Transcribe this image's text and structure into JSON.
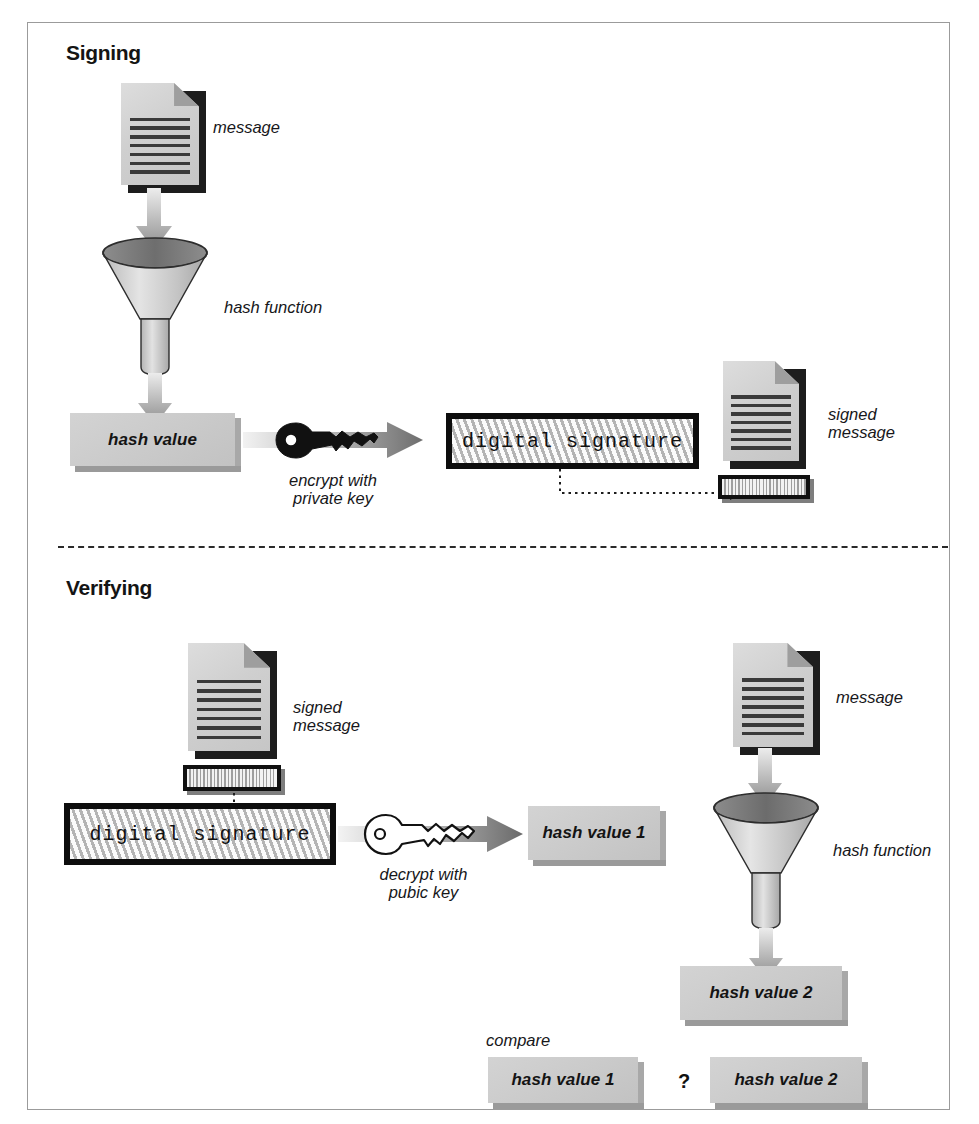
{
  "figure": {
    "sections": [
      {
        "id": "signing",
        "label": "Signing"
      },
      {
        "id": "verifying",
        "label": "Verifying"
      }
    ]
  },
  "signing": {
    "heading": "Signing",
    "message_label": "message",
    "hash_function_label": "hash function",
    "hash_value_label": "hash value",
    "key_caption": "encrypt with\nprivate key",
    "key_type": "private",
    "digital_signature_label": "digital signature",
    "signed_message_label": "signed\nmessage"
  },
  "verifying": {
    "heading": "Verifying",
    "signed_message_label": "signed\nmessage",
    "digital_signature_label": "digital signature",
    "key_caption": "decrypt with\npubic key",
    "key_type": "public",
    "hash_value_1_label": "hash value 1",
    "message_label": "message",
    "hash_function_label": "hash function",
    "hash_value_2_label": "hash value 2",
    "compare_label": "compare",
    "compare_left": "hash value 1",
    "compare_operator": "?",
    "compare_right": "hash value 2"
  },
  "colors": {
    "frame_border": "#9b9b9b",
    "box_fill": "#cccccc",
    "box_shadow": "#9a9a9a",
    "ink": "#141414",
    "arrow_light": "#e8e8e8",
    "arrow_dark": "#6e6e6e",
    "hatch_light": "#fbfbfb",
    "hatch_dark": "#b4b4b4",
    "key_private": "#111111",
    "key_public": "#ffffff"
  },
  "icons": {
    "document": "document-icon",
    "funnel": "funnel-icon",
    "key": "key-icon",
    "arrow_down": "arrow-down-icon",
    "arrow_right": "arrow-right-icon"
  }
}
